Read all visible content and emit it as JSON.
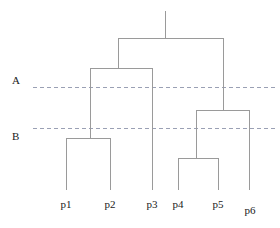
{
  "figure": {
    "kind": "dendrogram",
    "background_color": "#ffffff",
    "width": 280,
    "height": 228,
    "branch_color": "#9a9a9a",
    "cut_line_color": "#9aa0b4",
    "text_color": "#1a1a1a"
  },
  "chart_data": {
    "type": "line",
    "title": "",
    "subtitle": "",
    "xlabel": "",
    "ylabel": "",
    "grid": false,
    "legend": "none",
    "orientation": "top-down",
    "leaves": [
      {
        "id": "p1",
        "label": "p1",
        "x": 66,
        "label_x": 66,
        "label_y": 198
      },
      {
        "id": "p2",
        "label": "p2",
        "x": 110,
        "label_x": 110,
        "label_y": 198
      },
      {
        "id": "p3",
        "label": "p3",
        "x": 152,
        "label_x": 152,
        "label_y": 198
      },
      {
        "id": "p4",
        "label": "p4",
        "x": 178,
        "label_x": 178,
        "label_y": 198
      },
      {
        "id": "p5",
        "label": "p5",
        "x": 218,
        "label_x": 218,
        "label_y": 198
      },
      {
        "id": "p6",
        "label": "p6",
        "x": 249,
        "label_x": 250,
        "label_y": 204
      }
    ],
    "leaf_baseline_y": 190,
    "merges": [
      {
        "id": "m_p1_p2",
        "children": [
          "p1",
          "p2"
        ],
        "x": 90,
        "y": 138,
        "left_x": 66,
        "right_x": 110
      },
      {
        "id": "m_p4_p5",
        "children": [
          "p4",
          "p5"
        ],
        "x": 196,
        "y": 158,
        "left_x": 178,
        "right_x": 218
      },
      {
        "id": "m_left",
        "children": [
          "m_p1_p2",
          "p3"
        ],
        "x": 118,
        "y": 68,
        "left_x": 90,
        "right_x": 152
      },
      {
        "id": "m_right",
        "children": [
          "m_p4_p5",
          "p6"
        ],
        "x": 223,
        "y": 110,
        "left_x": 196,
        "right_x": 249
      },
      {
        "id": "m_root",
        "children": [
          "m_left",
          "m_right"
        ],
        "x": 165,
        "y": 38,
        "left_x": 118,
        "right_x": 223
      }
    ],
    "root_stem": {
      "x": 165,
      "y_top": 11,
      "y_bottom": 38
    },
    "cut_lines": [
      {
        "id": "cut-a",
        "label": "A",
        "y": 87,
        "x_start": 33,
        "x_end": 276,
        "label_x": 12,
        "label_y": 74
      },
      {
        "id": "cut-b",
        "label": "B",
        "y": 128,
        "x_start": 33,
        "x_end": 276,
        "label_x": 12,
        "label_y": 130
      }
    ]
  }
}
